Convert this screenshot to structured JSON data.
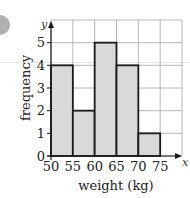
{
  "chart_data": {
    "type": "bar",
    "subtype": "histogram",
    "title": "",
    "xlabel": "weight (kg)",
    "ylabel": "frequency",
    "x_axis_symbol": "x",
    "y_axis_symbol": "y",
    "bins": [
      {
        "from": 50,
        "to": 55,
        "value": 4
      },
      {
        "from": 55,
        "to": 60,
        "value": 2
      },
      {
        "from": 60,
        "to": 65,
        "value": 5
      },
      {
        "from": 65,
        "to": 70,
        "value": 4
      },
      {
        "from": 70,
        "to": 75,
        "value": 1
      }
    ],
    "categories": [
      "50-55",
      "55-60",
      "60-65",
      "65-70",
      "70-75"
    ],
    "values": [
      4,
      2,
      5,
      4,
      1
    ],
    "xlim": [
      50,
      80
    ],
    "ylim": [
      0,
      6
    ],
    "xticks": [
      50,
      55,
      60,
      65,
      70,
      75
    ],
    "yticks": [
      0,
      1,
      2,
      3,
      4,
      5
    ],
    "grid": true,
    "colors": {
      "bar_fill": "#d9d9d9",
      "bar_edge": "#1a1a1a",
      "grid": "#b8b8b8",
      "axis": "#1a1a1a"
    }
  }
}
